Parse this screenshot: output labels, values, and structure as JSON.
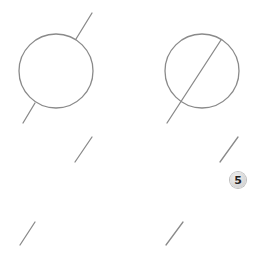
{
  "diagram": {
    "stroke_color": "#8a8a8a",
    "figures": [
      {
        "id": "circle-with-interrupted-line",
        "circle": {
          "cx": 56,
          "cy": 71,
          "r": 37
        },
        "line_segments": [
          {
            "x1": 76,
            "y1": 39,
            "x2": 92,
            "y2": 13
          },
          {
            "x1": 35,
            "y1": 103,
            "x2": 23,
            "y2": 123
          }
        ]
      },
      {
        "id": "circle-with-through-line",
        "circle": {
          "cx": 202,
          "cy": 71,
          "r": 37
        },
        "line_segments": [
          {
            "x1": 221,
            "y1": 40,
            "x2": 167,
            "y2": 123
          }
        ]
      }
    ],
    "slashes": [
      {
        "x1": 75,
        "y1": 162,
        "x2": 92,
        "y2": 137
      },
      {
        "x1": 220,
        "y1": 162,
        "x2": 238,
        "y2": 137
      },
      {
        "x1": 20,
        "y1": 245,
        "x2": 35,
        "y2": 222
      },
      {
        "x1": 166,
        "y1": 245,
        "x2": 183,
        "y2": 222
      }
    ],
    "badge": {
      "label": "5",
      "x": 230,
      "y": 172
    }
  }
}
